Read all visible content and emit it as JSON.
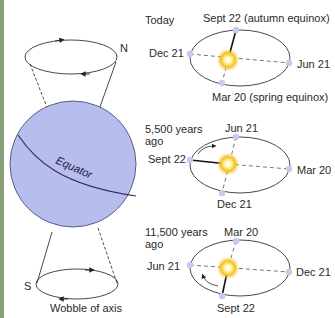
{
  "colors": {
    "edge_strip": "#8aa07a",
    "globe_fill": "#b7bdec",
    "globe_stroke": "#4a4e78",
    "line": "#333333",
    "earth_marker": "#c6c9f0",
    "sun_core": "#fff3b0",
    "sun_glow": "#f5b800"
  },
  "globe": {
    "equator_label": "Equator",
    "north_label": "N",
    "south_label": "S",
    "caption": "Wobble of axis"
  },
  "orbits": [
    {
      "title": "Today",
      "title_line2": "",
      "top": "Sept 22 (autumn equinox)",
      "left": "Dec 21",
      "right": "Jun 21",
      "bottom": "Mar 20 (spring equinox)"
    },
    {
      "title": "5,500 years",
      "title_line2": "ago",
      "top": "Jun 21",
      "left": "Sept 22",
      "right": "Mar 20",
      "bottom": "Dec 21"
    },
    {
      "title": "11,500 years",
      "title_line2": "ago",
      "top": "Mar 20",
      "left": "Jun 21",
      "right": "Dec 21",
      "bottom": "Sept 22"
    }
  ]
}
